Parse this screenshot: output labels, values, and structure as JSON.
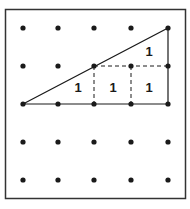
{
  "diagram": {
    "type": "geoboard-dot-grid",
    "grid": {
      "columns": 5,
      "rows": 5,
      "x": [
        23,
        58,
        94,
        131,
        168
      ],
      "y": [
        28,
        66,
        104,
        142,
        180
      ]
    },
    "triangle": {
      "vertices": [
        [
          0,
          2
        ],
        [
          4,
          2
        ],
        [
          4,
          0
        ]
      ]
    },
    "dashed_segments": [
      [
        [
          2,
          1
        ],
        [
          4,
          1
        ]
      ],
      [
        [
          2,
          1
        ],
        [
          2,
          2
        ]
      ],
      [
        [
          3,
          1
        ],
        [
          3,
          2
        ]
      ]
    ],
    "labels": [
      {
        "text": "1",
        "x": 78,
        "y": 92
      },
      {
        "text": "1",
        "x": 113,
        "y": 92
      },
      {
        "text": "1",
        "x": 149,
        "y": 92
      },
      {
        "text": "1",
        "x": 149,
        "y": 56
      }
    ],
    "colors": {
      "ink": "#1a1a1a",
      "border": "#333333",
      "background": "#ffffff"
    }
  }
}
